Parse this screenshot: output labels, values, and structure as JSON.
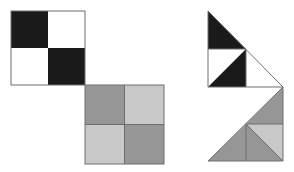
{
  "figure": {
    "title": "Checkerboard squares and triangular rearrangements",
    "background_color": "#ffffff",
    "canvas": {
      "width": 294,
      "height": 172
    },
    "palette": {
      "black": "#1a1a1a",
      "white": "#ffffff",
      "gray_dark": "#969696",
      "gray_light": "#c8c8c8",
      "outline": "#6e6e6e",
      "outline_dark": "#555555"
    },
    "stroke_width": 1,
    "shapes": [
      {
        "name": "black-white-checker-square",
        "kind": "square",
        "label": "Black and white 2x2 checkerboard",
        "bounds": {
          "x": 11,
          "y": 11,
          "width": 74,
          "height": 74
        },
        "cells": [
          {
            "name": "cell-top-left",
            "points": "11,11 48,11 48,48 11,48",
            "fill": "#1a1a1a"
          },
          {
            "name": "cell-top-right",
            "points": "48,11 85,11 85,48 48,48",
            "fill": "#ffffff"
          },
          {
            "name": "cell-bottom-left",
            "points": "11,48 48,48 48,85 11,85",
            "fill": "#ffffff"
          },
          {
            "name": "cell-bottom-right",
            "points": "48,48 85,48 85,85 48,85",
            "fill": "#1a1a1a"
          }
        ]
      },
      {
        "name": "gray-checker-square",
        "kind": "square",
        "label": "Dark and light gray 2x2 checkerboard",
        "bounds": {
          "x": 85,
          "y": 85,
          "width": 79,
          "height": 79
        },
        "cells": [
          {
            "name": "cell-top-left",
            "points": "85,85 124.5,85 124.5,124.5 85,124.5",
            "fill": "#969696"
          },
          {
            "name": "cell-top-right",
            "points": "124.5,85 164,85 164,124.5 124.5,124.5",
            "fill": "#c8c8c8"
          },
          {
            "name": "cell-bottom-left",
            "points": "85,124.5 124.5,124.5 124.5,164 85,164",
            "fill": "#c8c8c8"
          },
          {
            "name": "cell-bottom-right",
            "points": "124.5,124.5 164,124.5 164,164 124.5,164",
            "fill": "#969696"
          }
        ]
      },
      {
        "name": "black-white-triangle-figure",
        "kind": "triangle",
        "label": "Black and white right triangle rearrangement",
        "bounds": {
          "x": 208,
          "y": 11,
          "width": 75,
          "height": 76
        },
        "cells": [
          {
            "name": "upper-black-triangle",
            "points": "208,11 208,49 246,49",
            "fill": "#1a1a1a"
          },
          {
            "name": "lower-left-white-triangle",
            "points": "208,49 246,49 208,87",
            "fill": "#ffffff"
          },
          {
            "name": "lower-right-black-triangle",
            "points": "246,49 246,87 208,87",
            "fill": "#1a1a1a"
          },
          {
            "name": "right-white-triangle",
            "points": "246,49 283,87 246,87",
            "fill": "#ffffff"
          }
        ],
        "hypotenuse": "208,11 283,87"
      },
      {
        "name": "gray-triangle-figure",
        "kind": "triangle",
        "label": "Gray right triangle rearrangement",
        "bounds": {
          "x": 208,
          "y": 87,
          "width": 75,
          "height": 74
        },
        "cells": [
          {
            "name": "upper-dark-gray-triangle",
            "points": "283,87 283,124 246,124",
            "fill": "#969696"
          },
          {
            "name": "left-dark-gray-triangle",
            "points": "208,161 246,124 246,161",
            "fill": "#969696"
          },
          {
            "name": "large-light-gray-triangle",
            "points": "283,87 246,124 208,161",
            "fill": "#c8c8c8"
          },
          {
            "name": "lower-right-light-gray-triangle",
            "points": "246,124 283,124 283,161 246,161",
            "fill": "#c8c8c8"
          }
        ],
        "hypotenuse": "283,87 208,161"
      }
    ]
  }
}
